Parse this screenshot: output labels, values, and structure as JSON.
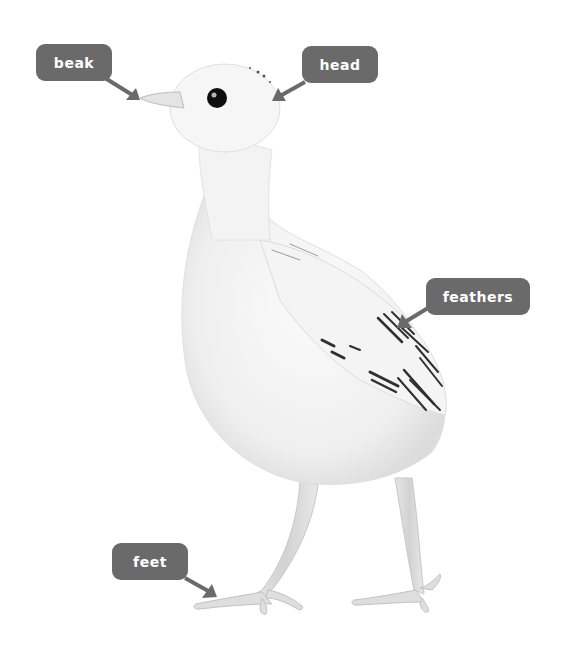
{
  "diagram": {
    "labels": [
      {
        "id": "beak",
        "text": "beak"
      },
      {
        "id": "head",
        "text": "head"
      },
      {
        "id": "feathers",
        "text": "feathers"
      },
      {
        "id": "feet",
        "text": "feet"
      }
    ],
    "colors": {
      "label_bg": "#6a6a6a",
      "label_text": "#ffffff",
      "arrow": "#6a6a6a",
      "background": "#ffffff"
    }
  }
}
